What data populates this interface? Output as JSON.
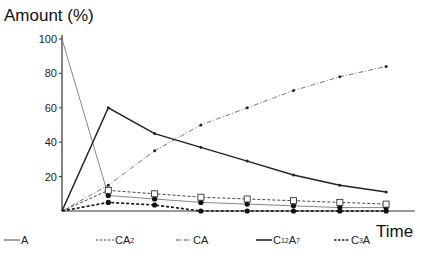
{
  "chart_data": {
    "type": "line",
    "title": "",
    "xlabel": "Time",
    "ylabel": "Amount (%)",
    "ylim": [
      0,
      100
    ],
    "yticks": [
      20,
      40,
      60,
      80,
      100
    ],
    "x": [
      0,
      1,
      2,
      3,
      4,
      5,
      6,
      7
    ],
    "grid": false,
    "legend_position": "bottom",
    "series": [
      {
        "name": "A",
        "style": "thin-solid",
        "marker": "filled-circle",
        "values": [
          100,
          9,
          7,
          5,
          4,
          3,
          2,
          2
        ]
      },
      {
        "name": "CA2",
        "style": "dashed",
        "marker": "open-square",
        "values": [
          0,
          12,
          10,
          8,
          7,
          6,
          5,
          4
        ]
      },
      {
        "name": "CA",
        "style": "dash-dot",
        "marker": "small-dot",
        "values": [
          0,
          15,
          35,
          50,
          60,
          70,
          78,
          84
        ]
      },
      {
        "name": "C12A7",
        "style": "thick-solid",
        "marker": "small-dot",
        "values": [
          0,
          60,
          45,
          37,
          29,
          21,
          15,
          11
        ]
      },
      {
        "name": "C3A",
        "style": "thick-dashed",
        "marker": "filled-circle",
        "values": [
          0,
          5,
          3.5,
          0,
          0,
          0,
          0,
          0
        ]
      }
    ]
  },
  "labels": {
    "y_axis_title": "Amount (%)",
    "x_axis_title": "Time",
    "yticks": [
      "100",
      "80",
      "60",
      "40",
      "20"
    ]
  },
  "legend": [
    {
      "base": "A",
      "sub": "",
      "tail": ""
    },
    {
      "base": "CA",
      "sub": "2",
      "tail": ""
    },
    {
      "base": "CA",
      "sub": "",
      "tail": ""
    },
    {
      "base": "C",
      "sub": "12",
      "tail": "A",
      "sub2": "7"
    },
    {
      "base": "C",
      "sub": "3",
      "tail": "A",
      "sub2": ""
    }
  ]
}
